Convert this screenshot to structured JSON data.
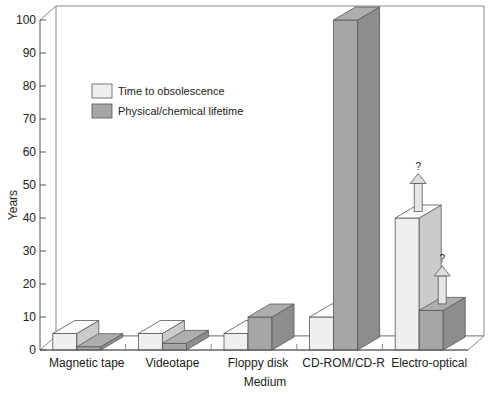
{
  "chart_data": {
    "type": "bar",
    "subtype": "3d-grouped",
    "title": "",
    "xlabel": "Medium",
    "ylabel": "Years",
    "ylim": [
      0,
      100
    ],
    "yticks": [
      0,
      10,
      20,
      30,
      40,
      50,
      60,
      70,
      80,
      90,
      100
    ],
    "categories": [
      "Magnetic tape",
      "Videotape",
      "Floppy disk",
      "CD-ROM/CD-R",
      "Electro-optical"
    ],
    "series": [
      {
        "name": "Time to obsolescence",
        "color": "#efefef",
        "values": [
          5,
          5,
          5,
          10,
          40
        ]
      },
      {
        "name": "Physical/chemical lifetime",
        "color": "#a6a6a6",
        "values": [
          1,
          2,
          10,
          100,
          12
        ]
      }
    ],
    "annotations": [
      {
        "category": "Electro-optical",
        "series": "Time to obsolescence",
        "type": "up-arrow",
        "text": "?"
      },
      {
        "category": "Electro-optical",
        "series": "Physical/chemical lifetime",
        "type": "up-arrow",
        "text": "?"
      }
    ],
    "legend": {
      "position": "upper-left-inside"
    },
    "grid": false
  }
}
